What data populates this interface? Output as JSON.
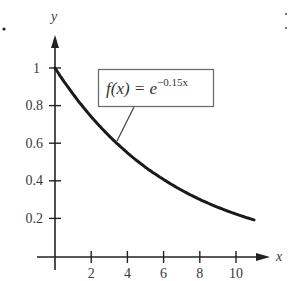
{
  "chart_data": {
    "type": "line",
    "title": "",
    "function_label": "f(x) = e^(-0.15x)",
    "xlabel": "x",
    "ylabel": "y",
    "xlim": [
      0,
      11
    ],
    "ylim": [
      0,
      1
    ],
    "x_ticks": [
      2,
      4,
      6,
      8,
      10
    ],
    "y_ticks": [
      0.2,
      0.4,
      0.6,
      0.8,
      1
    ],
    "grid": false,
    "legend": "none",
    "annotation": {
      "text": "f(x) = e^(-0.15x)",
      "style": "boxed callout with leader line to curve"
    },
    "series": [
      {
        "name": "f(x) = e^(-0.15x)",
        "x": [
          0,
          1,
          2,
          3,
          4,
          5,
          6,
          7,
          8,
          9,
          10,
          11
        ],
        "values": [
          1.0,
          0.861,
          0.741,
          0.638,
          0.549,
          0.472,
          0.407,
          0.35,
          0.301,
          0.259,
          0.223,
          0.192
        ]
      }
    ]
  },
  "labels": {
    "y_axis": "y",
    "x_axis": "x",
    "x_ticks": [
      "2",
      "4",
      "6",
      "8",
      "10"
    ],
    "y_ticks": [
      "1",
      "0.8",
      "0.6",
      "0.4",
      "0.2"
    ],
    "eq_main": "f(x) = e",
    "eq_exp": "−0.15x"
  }
}
